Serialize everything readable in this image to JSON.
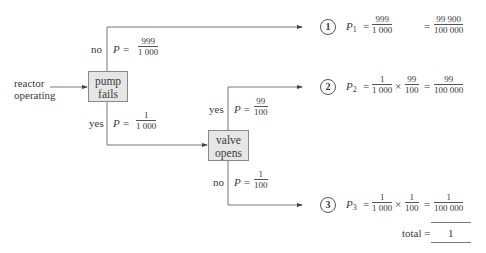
{
  "diagram": {
    "type": "probability-tree",
    "start_label": [
      "reactor",
      "operating"
    ],
    "nodes": {
      "pump": {
        "label": [
          "pump",
          "fails"
        ]
      },
      "valve": {
        "label": [
          "valve",
          "opens"
        ]
      }
    },
    "branches": {
      "pump_no": {
        "answer": "no",
        "p_prefix": "P =",
        "num": "999",
        "den": "1 000"
      },
      "pump_yes": {
        "answer": "yes",
        "p_prefix": "P =",
        "num": "1",
        "den": "1 000"
      },
      "valve_yes": {
        "answer": "yes",
        "p_prefix": "P =",
        "num": "99",
        "den": "100"
      },
      "valve_no": {
        "answer": "no",
        "p_prefix": "P =",
        "num": "1",
        "den": "100"
      }
    },
    "outcomes": [
      {
        "number": "1",
        "p_label": "P",
        "p_sub": "1",
        "eq": "=",
        "factors": [
          {
            "num": "999",
            "den": "1 000"
          }
        ],
        "result": {
          "num": "99 900",
          "den": "100 000"
        }
      },
      {
        "number": "2",
        "p_label": "P",
        "p_sub": "2",
        "eq": "=",
        "times": "×",
        "factors": [
          {
            "num": "1",
            "den": "1 000"
          },
          {
            "num": "99",
            "den": "100"
          }
        ],
        "result": {
          "num": "99",
          "den": "100 000"
        }
      },
      {
        "number": "3",
        "p_label": "P",
        "p_sub": "3",
        "eq": "=",
        "times": "×",
        "factors": [
          {
            "num": "1",
            "den": "1 000"
          },
          {
            "num": "1",
            "den": "100"
          }
        ],
        "result": {
          "num": "1",
          "den": "100 000"
        }
      }
    ],
    "total": {
      "label": "total =",
      "value": "1"
    }
  }
}
